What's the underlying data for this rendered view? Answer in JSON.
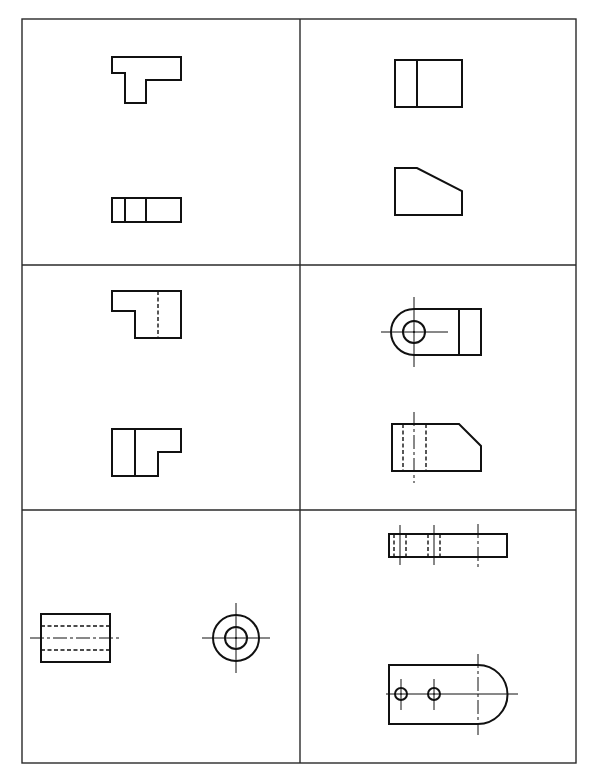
{
  "layout": {
    "frame": {
      "x": 22,
      "y": 19,
      "width": 554,
      "height": 744
    },
    "columns": 2,
    "rows": 3,
    "vertical_divider_x": 300,
    "horizontal_dividers_y": [
      265,
      510
    ]
  },
  "colors": {
    "line": "#111111",
    "frame": "#2a2a2a",
    "background": "#ffffff"
  },
  "line_types": [
    "visible-object-line",
    "hidden-dashed-line",
    "center-chain-line"
  ],
  "cells": [
    {
      "id": "r1c1",
      "views": [
        "T-shaped front view",
        "three-part rectangular top view"
      ]
    },
    {
      "id": "r1c2",
      "views": [
        "rectangle with one vertical line",
        "chamfered pentagon profile"
      ]
    },
    {
      "id": "r2c1",
      "views": [
        "L-step with hidden vertical line",
        "L-step with solid vertical line"
      ]
    },
    {
      "id": "r2c2",
      "views": [
        "rounded-end lug with hole and crosshair",
        "chamfered block with hidden hole lines"
      ]
    },
    {
      "id": "r3c1",
      "views": [
        "cylinder side view with hidden bore",
        "concentric circles end view"
      ]
    },
    {
      "id": "r3c2",
      "views": [
        "bar edge view with two hidden holes",
        "rounded plate with two holes"
      ]
    }
  ]
}
